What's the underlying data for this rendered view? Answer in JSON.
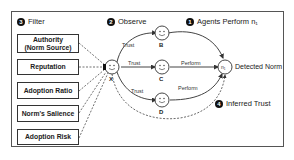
{
  "steps": {
    "filter": {
      "number": "3",
      "label": "Filter"
    },
    "observe": {
      "number": "2",
      "label": "Observe"
    },
    "agents_perform": {
      "number": "1",
      "label": "Agents Perform n₁"
    },
    "inferred_trust": {
      "number": "4",
      "label": "Inferred Trust"
    }
  },
  "filters": [
    {
      "label": "Authority\n(Norm Source)"
    },
    {
      "label": "Reputation"
    },
    {
      "label": "Adoption Ratio"
    },
    {
      "label": "Norm's Salience"
    },
    {
      "label": "Adoption Risk"
    }
  ],
  "nodes": {
    "x": "X",
    "b": "B",
    "c": "C",
    "d": "D",
    "norm": "n₁"
  },
  "edges": {
    "trust_b": "Trust",
    "trust_c": "Trust",
    "trust_d": "Trust",
    "perform_c": "Perform",
    "perform_d": "Perform"
  },
  "detected_norm": "Detected Norm"
}
